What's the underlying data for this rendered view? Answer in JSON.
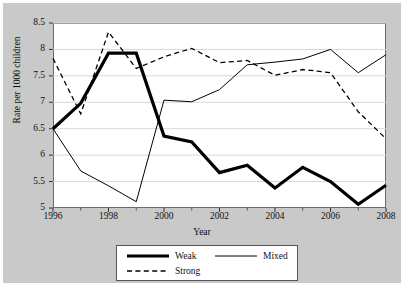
{
  "chart_data": {
    "type": "line",
    "title": "",
    "xlabel": "Year",
    "ylabel": "Rate per 1000 children",
    "x": [
      1996,
      1997,
      1998,
      1999,
      2000,
      2001,
      2002,
      2003,
      2004,
      2005,
      2006,
      2007,
      2008
    ],
    "xlim": [
      1996,
      2008
    ],
    "ylim": [
      5,
      8.5
    ],
    "xticks": [
      1996,
      1998,
      2000,
      2002,
      2004,
      2006,
      2008
    ],
    "xtick_labels": [
      "1996",
      "1998",
      "2000",
      "2002",
      "2004",
      "2006",
      "2008"
    ],
    "xminorticks": [
      1997,
      1999,
      2001,
      2003,
      2005,
      2007
    ],
    "yticks": [
      5,
      5.5,
      6,
      6.5,
      7,
      7.5,
      8,
      8.5
    ],
    "ytick_labels": [
      "5",
      "5.5",
      "6",
      "6.5",
      "7",
      "7.5",
      "8",
      "8.5"
    ],
    "grid": "horizontal",
    "legend_position": "below-center",
    "series": [
      {
        "name": "Weak",
        "style": "thick-solid",
        "color": "#000000",
        "values": [
          6.5,
          6.98,
          7.93,
          7.93,
          6.36,
          6.25,
          5.67,
          5.81,
          5.38,
          5.77,
          5.5,
          5.07,
          5.43
        ]
      },
      {
        "name": "Mixed",
        "style": "thin-solid",
        "color": "#000000",
        "values": [
          6.5,
          5.7,
          5.42,
          5.12,
          7.04,
          7.01,
          7.24,
          7.71,
          7.76,
          7.82,
          8.0,
          7.56,
          7.9
        ]
      },
      {
        "name": "Strong",
        "style": "dashed",
        "color": "#000000",
        "values": [
          7.83,
          6.78,
          8.33,
          7.64,
          7.86,
          8.02,
          7.75,
          7.79,
          7.51,
          7.62,
          7.56,
          6.82,
          6.31
        ]
      }
    ]
  },
  "legend": {
    "items": [
      {
        "label": "Weak"
      },
      {
        "label": "Mixed"
      },
      {
        "label": "Strong"
      }
    ]
  },
  "axis": {
    "ylabel": "Rate per 1000 children",
    "xlabel": "Year"
  },
  "colors": {
    "figure_background": "#c9c9c9",
    "plot_background": "#ffffff",
    "line": "#000000",
    "gridline": "#d8d8d8",
    "frame": "#6b6b6b"
  }
}
